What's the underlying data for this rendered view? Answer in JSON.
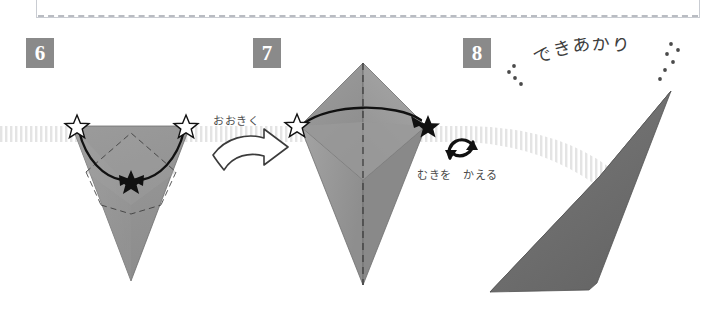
{
  "document": {
    "type": "origami-instruction-diagram",
    "language": "ja",
    "steps_shown": [
      6,
      7,
      8
    ]
  },
  "colors": {
    "paper_light": "#a3a3a3",
    "paper_mid": "#8f8f8f",
    "paper_dark": "#6f6f6f",
    "paper_darkest": "#5d5d5d",
    "badge_bg": "#8a8a8a",
    "badge_text": "#ffffff",
    "ink": "#111111",
    "band_stripe": "#e2e2e2",
    "panel_border": "#c9ccd2",
    "text_gray": "#4a4a4a"
  },
  "steps": [
    {
      "id": "step-6",
      "number": "6",
      "diagram": "inverted-triangle-with-inner-diamond-fold",
      "markers": [
        {
          "name": "star-outline-left",
          "style": "outline"
        },
        {
          "name": "star-outline-right",
          "style": "outline"
        },
        {
          "name": "star-filled-center",
          "style": "filled"
        }
      ],
      "arrows": [
        "curve-left-to-center",
        "curve-right-to-center"
      ]
    },
    {
      "id": "step-7",
      "number": "7",
      "diagram": "kite-rhombus-with-vertical-crease",
      "markers": [
        {
          "name": "star-outline-left",
          "style": "outline"
        },
        {
          "name": "star-filled-right",
          "style": "filled"
        }
      ],
      "arrows": [
        "arc-left-to-right"
      ]
    },
    {
      "id": "step-8",
      "number": "8",
      "diagram": "finished-dart-shape-3d",
      "markers": [],
      "arrows": []
    }
  ],
  "annotations": {
    "ookiku": "おおきく",
    "muki_wo_kaeru": "むきを　かえる",
    "dekiagari": "できあがり"
  },
  "icons": {
    "big_arrow": "hollow-curved-right-arrow",
    "flip": "circular-rotate-arrows",
    "star_outline": "star-outline-icon",
    "star_filled": "star-filled-icon"
  }
}
